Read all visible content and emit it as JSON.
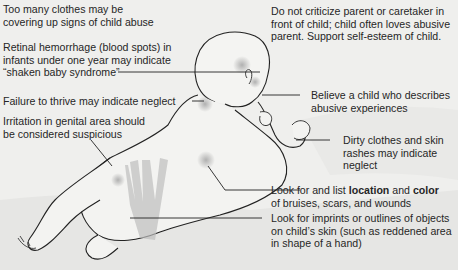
{
  "figure": {
    "colors": {
      "background": "#efefed",
      "line": "#222222",
      "bruise": "#b9b9b9",
      "text": "#262626"
    }
  },
  "annotations": {
    "clothes": {
      "lines": [
        "Too many clothes may be",
        "covering up signs of child abuse"
      ]
    },
    "retinal": {
      "lines": [
        "Retinal hemorrhage (blood spots) in",
        "infants under one year may indicate",
        "“shaken baby syndrome”"
      ]
    },
    "failure_to_thrive": {
      "lines": [
        "Failure to thrive may indicate neglect"
      ]
    },
    "genital": {
      "lines": [
        "Irritation in genital area should",
        "be considered suspicious"
      ]
    },
    "criticize": {
      "lines": [
        "Do not criticize parent or caretaker in",
        "front of child; child often loves abusive",
        "parent. Support self-esteem of child."
      ]
    },
    "believe": {
      "lines": [
        "Believe a child who describes",
        "abusive experiences"
      ]
    },
    "dirty_clothes": {
      "lines": [
        "Dirty clothes and skin",
        "rashes may indicate",
        "neglect"
      ]
    },
    "bruises": {
      "line1_a": "Look for and list ",
      "line1_b": "location",
      "line1_c": " and ",
      "line1_d": "color",
      "line2": "of bruises, scars, and wounds"
    },
    "imprints": {
      "lines": [
        "Look for imprints or outlines of objects",
        "on child’s skin (such as reddened area",
        "in shape of a hand)"
      ]
    }
  }
}
